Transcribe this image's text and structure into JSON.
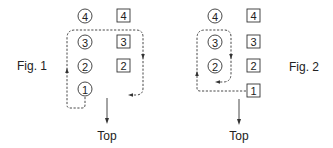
{
  "figures": [
    {
      "label": "Fig. 1",
      "circles": [
        "4",
        "3",
        "2",
        "1"
      ],
      "squares": [
        "4",
        "3",
        "2"
      ],
      "direction_label": "Top"
    },
    {
      "label": "Fig. 2",
      "circles": [
        "4",
        "3",
        "2"
      ],
      "squares": [
        "4",
        "3",
        "2",
        "1"
      ],
      "direction_label": "Top"
    }
  ]
}
